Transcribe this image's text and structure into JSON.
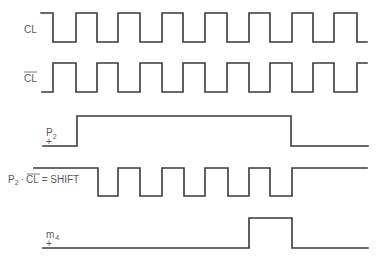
{
  "diagram": {
    "title": "",
    "signals": [
      {
        "id": "cl",
        "label": "CL",
        "overbar": false,
        "high_y": 13,
        "low_y": 42,
        "start_x": 41,
        "end_x": 367,
        "initial": "high",
        "transitions_x": [
          53,
          76,
          97,
          118,
          140,
          162,
          183,
          205,
          227,
          249,
          270,
          292,
          313,
          334,
          357
        ]
      },
      {
        "id": "cl-bar",
        "label": "CL",
        "overbar": true,
        "high_y": 63,
        "low_y": 92,
        "start_x": 42,
        "end_x": 367,
        "initial": "low",
        "transitions_x": [
          53,
          76,
          97,
          118,
          140,
          162,
          183,
          205,
          227,
          249,
          270,
          292,
          313,
          334,
          357
        ]
      },
      {
        "id": "p2",
        "label": "P",
        "subscript": "2",
        "polarity": "+",
        "high_y": 116,
        "low_y": 146,
        "start_x": 43,
        "end_x": 368,
        "initial": "low",
        "transitions_x": [
          77,
          291
        ]
      },
      {
        "id": "shift",
        "label": "P2 · CL = SHIFT",
        "label_parts": {
          "p": "P",
          "sub": "2",
          "dot": "·",
          "cl": "CL",
          "eq": "= SHIFT"
        },
        "high_y": 168,
        "low_y": 196,
        "start_x": 34,
        "end_x": 367,
        "initial": "high",
        "transitions_x": [
          98,
          118,
          140,
          162,
          184,
          205,
          228,
          249,
          270,
          292
        ]
      },
      {
        "id": "m4",
        "label": "m",
        "subscript": "4",
        "polarity": "+",
        "high_y": 218,
        "low_y": 248,
        "start_x": 43,
        "end_x": 368,
        "initial": "low",
        "transitions_x": [
          249,
          292
        ]
      }
    ],
    "colors": {
      "stroke": "#3a3a3a",
      "text": "#5a5a5a",
      "background": "#ffffff"
    }
  }
}
